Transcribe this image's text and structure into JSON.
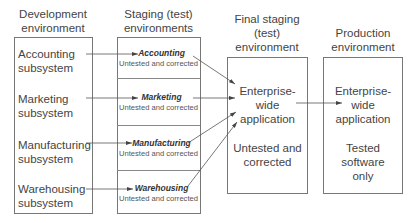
{
  "columns": {
    "development": {
      "header_line1": "Development",
      "header_line2": "environment",
      "subsystems": [
        {
          "line1": "Accounting",
          "line2": "subsystem"
        },
        {
          "line1": "Marketing",
          "line2": "subsystem"
        },
        {
          "line1": "Manufacturing",
          "line2": "subsystem"
        },
        {
          "line1": "Warehousing",
          "line2": "subsystem"
        }
      ]
    },
    "staging": {
      "header_line1": "Staging (test)",
      "header_line2": "environments",
      "items": [
        {
          "title": "Accounting",
          "status": "Untested and corrected"
        },
        {
          "title": "Marketing",
          "status": "Untested and corrected"
        },
        {
          "title": "Manufacturing",
          "status": "Untested and corrected"
        },
        {
          "title": "Warehousing",
          "status": "Untested and corrected"
        }
      ]
    },
    "final_staging": {
      "header_line1": "Final staging",
      "header_line2": "(test)",
      "header_line3": "environment",
      "app_line1": "Enterprise-",
      "app_line2": "wide",
      "app_line3": "application",
      "status_line1": "Untested and",
      "status_line2": "corrected"
    },
    "production": {
      "header_line1": "Production",
      "header_line2": "environment",
      "app_line1": "Enterprise-",
      "app_line2": "wide",
      "app_line3": "application",
      "status_line1": "Tested",
      "status_line2": "software",
      "status_line3": "only"
    }
  },
  "colors": {
    "line": "#555555",
    "border": "#777777",
    "text": "#444444"
  }
}
